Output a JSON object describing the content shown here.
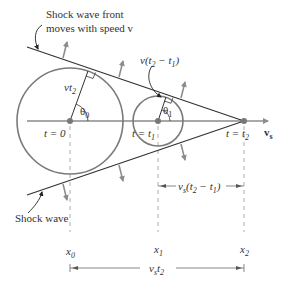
{
  "figure": {
    "colors": {
      "background": "#ffffff",
      "circle": "#7a7a7a",
      "axis": "#8a8a8a",
      "shock_line": "#333333",
      "arrow": "#8c8c8c",
      "dash": "#9a9a9a",
      "point": "#777777",
      "text": "#333333"
    },
    "labels": {
      "front_line1": "Shock wave front",
      "front_line2": "moves with speed v",
      "shock_wave": "Shock wave",
      "vt2_v": "vt",
      "vt2_sub": "2",
      "theta0": "θ",
      "theta0_sub": "0",
      "theta1": "θ",
      "theta1_sub": "1",
      "v_t2_t1": "v(t",
      "v_t2_t1_sub2": "2",
      "v_t2_t1_mid": " − t",
      "v_t2_t1_sub1": "1",
      "v_t2_t1_end": ")",
      "t0": "t = 0",
      "t1_pre": "t = t",
      "t1_sub": "1",
      "t2_pre": "t = t",
      "t2_sub": "2",
      "vs": "v",
      "vs_sub": "s",
      "x0": "x",
      "x0_sub": "0",
      "x1": "x",
      "x1_sub": "1",
      "x2": "x",
      "x2_sub": "2",
      "vs_t2t1_pre": "v",
      "vs_t2t1_s": "s",
      "vs_t2t1_mid": "(t",
      "vs_t2t1_sub2": "2",
      "vs_t2t1_minus": " − t",
      "vs_t2t1_sub1": "1",
      "vs_t2t1_end": ")",
      "vs_t2_pre": "v",
      "vs_t2_s": "s",
      "vs_t2_t": "t",
      "vs_t2_sub": "2"
    }
  }
}
